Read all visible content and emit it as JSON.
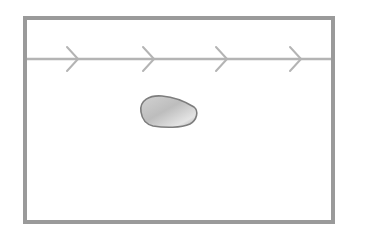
{
  "diagram": {
    "type": "flow-over-object",
    "colors": {
      "frame": "#9a9a9a",
      "flow_line": "#b4b4b4",
      "pebble_light": "#e6e6e6",
      "pebble_dark": "#8e8e8e",
      "pebble_stroke": "#7a7a7a",
      "background": "#ffffff"
    },
    "frame": {
      "x": 25,
      "y": 18,
      "width": 308,
      "height": 204
    },
    "flow_line": {
      "y": 59,
      "x1": 27,
      "x2": 331,
      "direction": "right"
    },
    "arrows": [
      {
        "x": 72
      },
      {
        "x": 148
      },
      {
        "x": 221
      },
      {
        "x": 295
      }
    ],
    "pebble": {
      "cx": 167,
      "cy": 111,
      "label": ""
    }
  }
}
